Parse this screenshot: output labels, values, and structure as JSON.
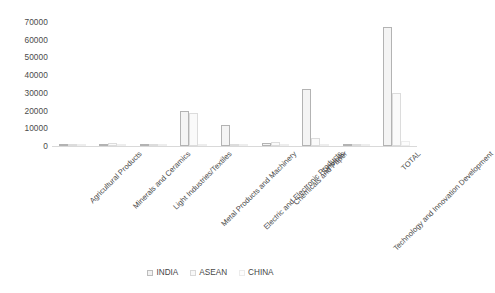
{
  "chart_data": {
    "type": "bar",
    "title": "",
    "subtitle": "",
    "xlabel": "",
    "ylabel": "",
    "ylim": [
      0,
      70000
    ],
    "ytick_step": 10000,
    "yticks": [
      "70000",
      "60000",
      "50000",
      "40000",
      "30000",
      "20000",
      "10000",
      "0"
    ],
    "grid": false,
    "legend_position": "bottom",
    "orientation": "vertical",
    "categories": [
      "Agricultural Products",
      "Minerals and Ceramics",
      "Light Industries/Textiles",
      "Metal Products and Machinery",
      "Electric and Electronic Products",
      "Chemicals and Paper",
      "Services",
      "Technology and Innovation Development",
      "TOTAL"
    ],
    "series": [
      {
        "name": "INDIA",
        "color": "#f2f2f2",
        "border": "#b3b3b3",
        "values": [
          1200,
          600,
          900,
          20000,
          12000,
          1500,
          32000,
          300,
          67000
        ]
      },
      {
        "name": "ASEAN",
        "color": "#f8f8f8",
        "border": "#d8d8d8",
        "values": [
          700,
          1800,
          400,
          18500,
          1200,
          2500,
          4500,
          200,
          30000
        ]
      },
      {
        "name": "CHINA",
        "color": "#fdfdfd",
        "border": "#ececec",
        "values": [
          300,
          400,
          300,
          800,
          600,
          700,
          1200,
          150,
          3000
        ]
      }
    ]
  },
  "legend": {
    "items": [
      {
        "label": "INDIA"
      },
      {
        "label": "ASEAN"
      },
      {
        "label": "CHINA"
      }
    ]
  }
}
